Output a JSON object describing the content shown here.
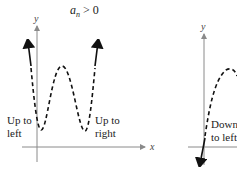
{
  "left_panel": {
    "title_var": "a",
    "title_sub": "n",
    "title_rel": " > 0",
    "y_label": "y",
    "x_label": "x",
    "left_label": [
      "Up to",
      "left"
    ],
    "right_label": [
      "Up to",
      "right"
    ]
  },
  "right_panel": {
    "y_label": "y",
    "left_label": [
      "Down",
      "to left"
    ]
  },
  "colors": {
    "axis": "#8a8a8a",
    "curve": "#111111",
    "text": "#222222"
  }
}
